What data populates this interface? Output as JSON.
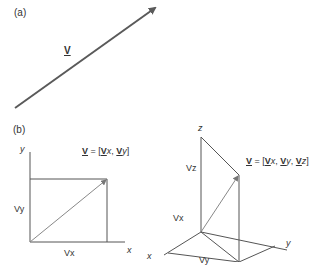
{
  "panel_a": {
    "label": "(a)",
    "vector_label": "V"
  },
  "panel_b": {
    "label": "(b)",
    "diagram_2d": {
      "axis_y": "y",
      "axis_x": "x",
      "component_y": "Vy",
      "component_x": "Vx",
      "formula": {
        "v": "V",
        "eq": " = [",
        "vx_bold": "V",
        "vx_sub": "x",
        "sep": ", ",
        "vy_bold": "V",
        "vy_sub": "y",
        "close": "]"
      }
    },
    "diagram_3d": {
      "axis_z": "z",
      "axis_x": "x",
      "axis_y": "y",
      "component_z": "Vz",
      "component_x": "Vx",
      "component_y": "Vy",
      "formula": {
        "v": "V",
        "eq": " = [",
        "vx_bold": "V",
        "vx_sub": "x",
        "sep1": ", ",
        "vy_bold": "V",
        "vy_sub": "y",
        "sep2": ", ",
        "vz_bold": "V",
        "vz_sub": "z",
        "close": "]"
      }
    }
  },
  "colors": {
    "line": "#555555",
    "arrow_a": "#5a5a5a",
    "text": "#333333"
  }
}
